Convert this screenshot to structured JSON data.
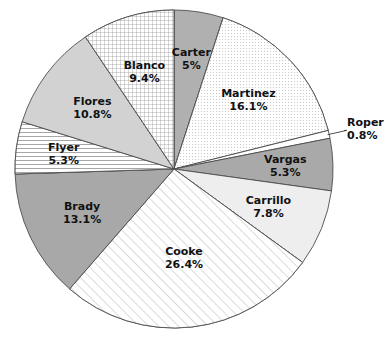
{
  "chart_data": {
    "type": "pie",
    "title": "",
    "subtitle": "",
    "xlabel": "",
    "ylabel": "",
    "legend_position": "none",
    "grid": false,
    "label_format": "name + percent",
    "start_angle_deg": 0,
    "direction": "clockwise",
    "categories": [
      "Carter",
      "Martinez",
      "Roper",
      "Vargas",
      "Carrillo",
      "Cooke",
      "Brady",
      "Flyer",
      "Flores",
      "Blanco"
    ],
    "values": [
      5.0,
      16.1,
      0.8,
      5.3,
      7.8,
      26.4,
      13.1,
      5.3,
      10.8,
      9.4
    ],
    "slices": [
      {
        "name": "Carter",
        "percent": 5.0,
        "percent_label": "5%",
        "fill": "#b0b0b0",
        "pattern": "solid",
        "label_placement": "inside"
      },
      {
        "name": "Martinez",
        "percent": 16.1,
        "percent_label": "16.1%",
        "fill": "#fbfbfb",
        "pattern": "fine-dots",
        "label_placement": "inside"
      },
      {
        "name": "Roper",
        "percent": 0.8,
        "percent_label": "0.8%",
        "fill": "#ffffff",
        "pattern": "solid",
        "label_placement": "outside"
      },
      {
        "name": "Vargas",
        "percent": 5.3,
        "percent_label": "5.3%",
        "fill": "#a9a9a9",
        "pattern": "solid",
        "label_placement": "inside"
      },
      {
        "name": "Carrillo",
        "percent": 7.8,
        "percent_label": "7.8%",
        "fill": "#eeeeee",
        "pattern": "solid",
        "label_placement": "inside"
      },
      {
        "name": "Cooke",
        "percent": 26.4,
        "percent_label": "26.4%",
        "fill": "#fcfcfc",
        "pattern": "diagonal-hatch",
        "label_placement": "inside"
      },
      {
        "name": "Brady",
        "percent": 13.1,
        "percent_label": "13.1%",
        "fill": "#a8a8a8",
        "pattern": "solid",
        "label_placement": "inside"
      },
      {
        "name": "Flyer",
        "percent": 5.3,
        "percent_label": "5.3%",
        "fill": "#fdfdfd",
        "pattern": "horizontal-lines",
        "label_placement": "inside"
      },
      {
        "name": "Flores",
        "percent": 10.8,
        "percent_label": "10.8%",
        "fill": "#d2d2d2",
        "pattern": "solid",
        "label_placement": "inside"
      },
      {
        "name": "Blanco",
        "percent": 9.4,
        "percent_label": "9.4%",
        "fill": "#fbfbfb",
        "pattern": "cross-hatch",
        "label_placement": "inside"
      }
    ]
  },
  "colors": {
    "outline": "#4d4d4d",
    "text": "#111111",
    "background": "#ffffff"
  }
}
